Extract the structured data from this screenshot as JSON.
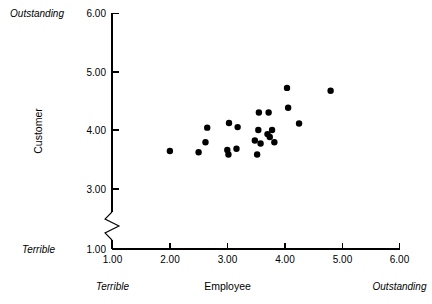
{
  "chart_data": {
    "type": "scatter",
    "title": "",
    "xlabel": "Employee",
    "ylabel": "Customer",
    "xlim": [
      1.0,
      6.0
    ],
    "ylim": [
      1.0,
      6.0
    ],
    "grid": false,
    "legend": null,
    "axis_break": {
      "axis": "y",
      "between": [
        1.0,
        3.0
      ],
      "note": "zigzag break symbol on vertical axis below 3.00"
    },
    "x_ticks": [
      "1.00",
      "2.00",
      "3.00",
      "4.00",
      "5.00",
      "6.00"
    ],
    "x_tick_values": [
      1.0,
      2.0,
      3.0,
      4.0,
      5.0,
      6.0
    ],
    "y_ticks": [
      "1.00",
      "3.00",
      "4.00",
      "5.00",
      "6.00"
    ],
    "y_tick_values": [
      1.0,
      3.0,
      4.0,
      5.0,
      6.0
    ],
    "x_anchor_low": "Terrible",
    "x_anchor_high": "Outstanding",
    "y_anchor_low": "Terrible",
    "y_anchor_high": "Outstanding",
    "marker": {
      "shape": "circle",
      "color": "#000000",
      "size": 3.2
    },
    "points": [
      {
        "x": 2.0,
        "y": 3.64
      },
      {
        "x": 2.5,
        "y": 3.62
      },
      {
        "x": 2.62,
        "y": 3.79
      },
      {
        "x": 2.65,
        "y": 4.04
      },
      {
        "x": 3.0,
        "y": 3.66
      },
      {
        "x": 3.02,
        "y": 3.58
      },
      {
        "x": 3.03,
        "y": 4.12
      },
      {
        "x": 3.16,
        "y": 3.68
      },
      {
        "x": 3.18,
        "y": 4.05
      },
      {
        "x": 3.48,
        "y": 3.82
      },
      {
        "x": 3.52,
        "y": 3.58
      },
      {
        "x": 3.54,
        "y": 4.0
      },
      {
        "x": 3.55,
        "y": 4.3
      },
      {
        "x": 3.58,
        "y": 3.77
      },
      {
        "x": 3.7,
        "y": 3.93
      },
      {
        "x": 3.72,
        "y": 4.3
      },
      {
        "x": 3.74,
        "y": 3.88
      },
      {
        "x": 3.78,
        "y": 4.0
      },
      {
        "x": 3.82,
        "y": 3.79
      },
      {
        "x": 4.04,
        "y": 4.72
      },
      {
        "x": 4.06,
        "y": 4.38
      },
      {
        "x": 4.25,
        "y": 4.11
      },
      {
        "x": 4.8,
        "y": 4.67
      }
    ]
  }
}
